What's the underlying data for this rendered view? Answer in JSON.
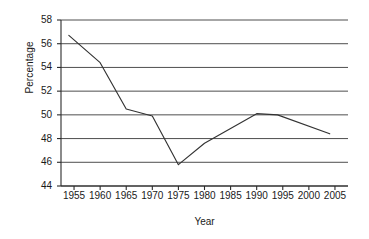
{
  "chart_data": {
    "type": "line",
    "title": "",
    "xlabel": "Year",
    "ylabel": "Percentage",
    "xlim": [
      1952.5,
      2007.5
    ],
    "ylim": [
      44,
      58
    ],
    "yticks": [
      44,
      46,
      48,
      50,
      52,
      54,
      56,
      58
    ],
    "xticks": [
      1955,
      1960,
      1965,
      1970,
      1975,
      1980,
      1985,
      1990,
      1995,
      2000,
      2005
    ],
    "grid": "horizontal",
    "legend": "none",
    "series": [
      {
        "name": "Percentage",
        "color": "#333333",
        "x": [
          1954,
          1960,
          1965,
          1970,
          1975,
          1980,
          1990,
          1994,
          2004
        ],
        "y": [
          56.7,
          54.4,
          50.5,
          49.9,
          45.8,
          47.6,
          50.1,
          50.0,
          48.4
        ]
      }
    ]
  },
  "axes": {
    "y_tick_labels": [
      "58",
      "56",
      "54",
      "52",
      "50",
      "48",
      "46",
      "44"
    ],
    "x_tick_labels": [
      "1955",
      "1960",
      "1965",
      "1970",
      "1975",
      "1980",
      "1985",
      "1990",
      "1995",
      "2000",
      "2005"
    ],
    "x_axis_title": "Year",
    "y_axis_title": "Percentage"
  },
  "colors": {
    "line": "#333333",
    "grid": "#3a3a3a",
    "axis": "#2b2b2b",
    "background": "#ffffff",
    "text": "#1a1a1a"
  }
}
